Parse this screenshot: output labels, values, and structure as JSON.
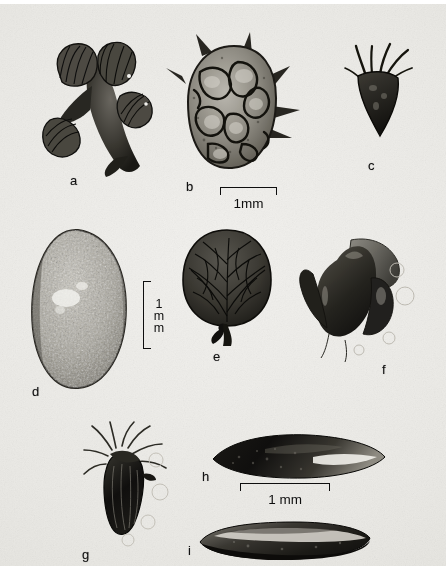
{
  "figure": {
    "kind": "photographic-plate",
    "background_color": "#e9e8e4",
    "ink_color": "#101010",
    "panel_count": 9
  },
  "panels": [
    {
      "id": "a",
      "label": "a",
      "description": "branched cluster of winged bracts / fruiting spikelets",
      "x": 70,
      "y": 176
    },
    {
      "id": "b",
      "label": "b",
      "description": "rounded reticulate-pitted fruit with marginal spines",
      "x": 190,
      "y": 182
    },
    {
      "id": "c",
      "label": "c",
      "description": "small dark triangular fruit with apical bristles",
      "x": 372,
      "y": 162
    },
    {
      "id": "d",
      "label": "d",
      "description": "large ovate speckled seed",
      "x": 36,
      "y": 388
    },
    {
      "id": "e",
      "label": "e",
      "description": "rounded reticulate-veined seed with short stalk",
      "x": 217,
      "y": 352
    },
    {
      "id": "f",
      "label": "f",
      "description": "dark lobed floret / glume cluster",
      "x": 386,
      "y": 366
    },
    {
      "id": "g",
      "label": "g",
      "description": "ribbed achene crowned with long bristles",
      "x": 86,
      "y": 551
    },
    {
      "id": "h",
      "label": "h",
      "description": "elongate fusiform grain, dorsal view",
      "x": 206,
      "y": 473
    },
    {
      "id": "i",
      "label": "i",
      "description": "elongate grain, lateral / ventral view",
      "x": 190,
      "y": 547
    }
  ],
  "scale_bars": [
    {
      "id": "scale-top",
      "caption": "1mm",
      "orientation": "horizontal",
      "x": 220,
      "y": 185,
      "length_px": 57
    },
    {
      "id": "scale-middle",
      "caption": "1mm",
      "orientation": "vertical",
      "x": 143,
      "y": 278,
      "length_px": 66
    },
    {
      "id": "scale-bottom",
      "caption": "1 mm",
      "orientation": "horizontal",
      "x": 240,
      "y": 481,
      "length_px": 90
    }
  ]
}
